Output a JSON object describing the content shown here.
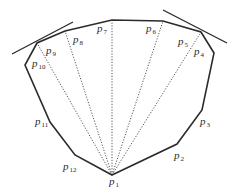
{
  "diagram": {
    "colors": {
      "edge": "#2b2b2b",
      "ray": "#555555",
      "label": "#2a2a2a",
      "background": "#ffffff"
    },
    "polygon": [
      {
        "id": "p1",
        "x": 112,
        "y": 175
      },
      {
        "id": "p2",
        "x": 177,
        "y": 144
      },
      {
        "id": "p3",
        "x": 202,
        "y": 110
      },
      {
        "id": "p4",
        "x": 214,
        "y": 53
      },
      {
        "id": "p5",
        "x": 201,
        "y": 32
      },
      {
        "id": "p6",
        "x": 163,
        "y": 21
      },
      {
        "id": "p7",
        "x": 112,
        "y": 20
      },
      {
        "id": "p8",
        "x": 65,
        "y": 31
      },
      {
        "id": "p9",
        "x": 37,
        "y": 43
      },
      {
        "id": "p10",
        "x": 25,
        "y": 65
      },
      {
        "id": "p11",
        "x": 50,
        "y": 122
      },
      {
        "id": "p12",
        "x": 75,
        "y": 155
      }
    ],
    "rays": [
      {
        "from": "p1",
        "to": "p5"
      },
      {
        "from": "p1",
        "to": "p6"
      },
      {
        "from": "p1",
        "to": "p7"
      },
      {
        "from": "p1",
        "to": "p8"
      },
      {
        "from": "p1",
        "to": "p9"
      }
    ],
    "tangents": [
      {
        "x1": 12,
        "y1": 54,
        "x2": 73,
        "y2": 22
      },
      {
        "x1": 163,
        "y1": 10,
        "x2": 227,
        "y2": 43
      }
    ],
    "labels": [
      {
        "base": "p",
        "sub": "1",
        "x": 109,
        "y": 178
      },
      {
        "base": "p",
        "sub": "2",
        "x": 174,
        "y": 152
      },
      {
        "base": "p",
        "sub": "3",
        "x": 200,
        "y": 118
      },
      {
        "base": "p",
        "sub": "4",
        "x": 194,
        "y": 48
      },
      {
        "base": "p",
        "sub": "5",
        "x": 178,
        "y": 38
      },
      {
        "base": "p",
        "sub": "6",
        "x": 146,
        "y": 25
      },
      {
        "base": "p",
        "sub": "7",
        "x": 97,
        "y": 25
      },
      {
        "base": "p",
        "sub": "8",
        "x": 73,
        "y": 36
      },
      {
        "base": "p",
        "sub": "9",
        "x": 46,
        "y": 47
      },
      {
        "base": "p",
        "sub": "10",
        "x": 32,
        "y": 60
      },
      {
        "base": "p",
        "sub": "11",
        "x": 35,
        "y": 118
      },
      {
        "base": "p",
        "sub": "12",
        "x": 63,
        "y": 163
      }
    ]
  }
}
